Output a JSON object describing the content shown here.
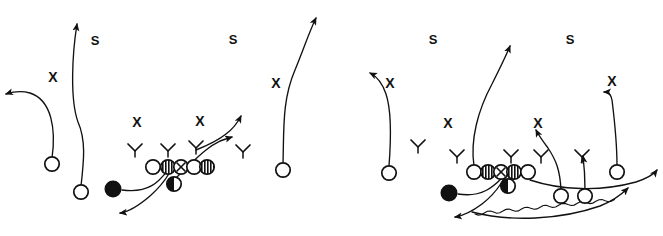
{
  "diagram": {
    "kind": "football-play-diagram",
    "panel_count": 2,
    "background_color": "#ffffff",
    "ink_color": "#111111",
    "style": "hand-drawn whiteboard sketch"
  },
  "labels": {
    "safety": "S",
    "defender": "X"
  },
  "panels": [
    {
      "id": "left-play",
      "name": "left-play-diagram",
      "defense_labels": [
        {
          "text": "S",
          "x": 95,
          "y": 45
        },
        {
          "text": "S",
          "x": 233,
          "y": 44
        },
        {
          "text": "X",
          "x": 53,
          "y": 82
        },
        {
          "text": "X",
          "x": 276,
          "y": 88
        },
        {
          "text": "X",
          "x": 137,
          "y": 127
        },
        {
          "text": "X",
          "x": 200,
          "y": 126
        }
      ],
      "linemen": [
        {
          "type": "open",
          "x": 153,
          "y": 167
        },
        {
          "type": "striped",
          "x": 168,
          "y": 167
        },
        {
          "type": "xcircle",
          "x": 181,
          "y": 167
        },
        {
          "type": "open",
          "x": 194,
          "y": 167
        },
        {
          "type": "striped",
          "x": 207,
          "y": 167
        }
      ],
      "backs": [
        {
          "type": "half",
          "x": 174,
          "y": 184,
          "role": "fullback"
        },
        {
          "type": "filled",
          "x": 113,
          "y": 189,
          "role": "ball-carrier"
        }
      ],
      "receivers": [
        {
          "type": "open",
          "x": 52,
          "y": 164,
          "role": "wide-receiver-left-outside"
        },
        {
          "type": "open",
          "x": 81,
          "y": 192,
          "role": "wide-receiver-left-inside"
        },
        {
          "type": "open",
          "x": 283,
          "y": 170,
          "role": "wide-receiver-right"
        }
      ],
      "chevrons": [
        {
          "x": 135,
          "y": 149
        },
        {
          "x": 168,
          "y": 149
        },
        {
          "x": 196,
          "y": 146
        },
        {
          "x": 243,
          "y": 150
        }
      ]
    },
    {
      "id": "right-play",
      "name": "right-play-diagram",
      "defense_labels": [
        {
          "text": "S",
          "x": 433,
          "y": 44
        },
        {
          "text": "S",
          "x": 570,
          "y": 44
        },
        {
          "text": "X",
          "x": 390,
          "y": 88
        },
        {
          "text": "X",
          "x": 612,
          "y": 86
        },
        {
          "text": "X",
          "x": 448,
          "y": 128
        },
        {
          "text": "X",
          "x": 538,
          "y": 128
        }
      ],
      "linemen": [
        {
          "type": "open",
          "x": 474,
          "y": 172
        },
        {
          "type": "striped",
          "x": 488,
          "y": 172
        },
        {
          "type": "xcircle",
          "x": 501,
          "y": 172
        },
        {
          "type": "striped",
          "x": 514,
          "y": 172
        },
        {
          "type": "open",
          "x": 528,
          "y": 172
        }
      ],
      "backs": [
        {
          "type": "half",
          "x": 508,
          "y": 186,
          "role": "fullback"
        },
        {
          "type": "filled",
          "x": 449,
          "y": 193,
          "role": "ball-carrier"
        }
      ],
      "receivers": [
        {
          "type": "open",
          "x": 389,
          "y": 173,
          "role": "wide-receiver-left"
        },
        {
          "type": "open",
          "x": 561,
          "y": 196,
          "role": "slot-receiver-inner"
        },
        {
          "type": "open",
          "x": 585,
          "y": 196,
          "role": "slot-receiver-outer"
        },
        {
          "type": "open",
          "x": 617,
          "y": 172,
          "role": "wide-receiver-right"
        }
      ],
      "chevrons": [
        {
          "x": 418,
          "y": 145
        },
        {
          "x": 457,
          "y": 155
        },
        {
          "x": 511,
          "y": 155
        },
        {
          "x": 541,
          "y": 155
        },
        {
          "x": 582,
          "y": 155
        }
      ]
    }
  ],
  "routes": {
    "left": [
      {
        "name": "route-left-outside-deep-out",
        "d": "M52,158 C56,130 52,100 30,93 C20,90 12,92 6,94"
      },
      {
        "name": "route-left-inside-vertical",
        "d": "M81,186 C84,160 86,140 78,122 C70,100 72,55 77,24"
      },
      {
        "name": "route-right-wr-vertical",
        "d": "M283,164 C284,130 282,100 295,70 C304,48 310,30 316,18"
      },
      {
        "name": "route-ballcarrier-sweep",
        "d": "M122,190 C150,194 160,180 168,170 C176,162 168,180 150,196 C136,208 128,212 120,213"
      },
      {
        "name": "route-fullback-dive",
        "d": "M176,178 C186,168 196,158 206,150 C216,142 222,140 232,137"
      },
      {
        "name": "route-slot-cross",
        "d": "M196,150 C206,146 216,142 226,134 C234,128 238,122 241,116"
      }
    ],
    "right": [
      {
        "name": "route-left-wr-in",
        "d": "M389,166 C391,140 392,112 386,94 C382,82 376,76 370,73"
      },
      {
        "name": "route-center-vertical",
        "d": "M474,166 C470,140 478,110 492,84 C500,68 506,56 510,46"
      },
      {
        "name": "route-slot-out-up",
        "d": "M561,190 C560,170 556,160 548,148 C542,140 538,134 536,130"
      },
      {
        "name": "route-slot2-vertical",
        "d": "M585,190 C585,172 584,164 583,156"
      },
      {
        "name": "route-right-wr-comeback",
        "d": "M617,166 C617,140 614,116 612,100 C611,94 608,92 604,92"
      },
      {
        "name": "route-ballcarrier-sweep-r",
        "d": "M458,194 C482,198 494,186 502,178 C508,172 500,190 482,204 C470,213 462,216 455,217"
      },
      {
        "name": "route-motion-jet",
        "d": "M472,212 C510,222 560,220 600,206 C615,200 622,194 628,188"
      },
      {
        "name": "route-perimeter-arc",
        "d": "M530,180 C560,190 600,192 636,182 C648,178 654,174 657,170"
      }
    ]
  },
  "legend": {
    "open_circle": "offensive skill player",
    "striped_circle": "offensive lineman",
    "x_circle": "center",
    "filled_circle": "ball carrier",
    "half_circle": "quarterback/fullback",
    "chevron": "defender alignment mark",
    "S": "safety",
    "X": "cornerback/defender"
  }
}
